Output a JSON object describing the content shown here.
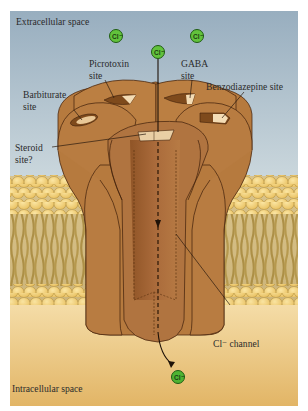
{
  "figure": {
    "regions": {
      "top": "Extracellular space",
      "bottom": "Intracellular space"
    },
    "labels": {
      "picrotoxin_1": "Picrotoxin",
      "picrotoxin_2": "site",
      "gaba_1": "GABA",
      "gaba_2": "site",
      "barbiturate_1": "Barbiturate",
      "barbiturate_2": "site",
      "benzodiazepine": "Benzodiazepine site",
      "steroid_1": "Steroid",
      "steroid_2": "site?",
      "channel": "Cl⁻ channel"
    },
    "ions": {
      "symbol": "Cl⁻",
      "count": 4
    },
    "colors": {
      "extracellular_top": "#9fb3c2",
      "extracellular_bottom": "#cbd7dc",
      "intracellular_top": "#f3d9a5",
      "intracellular_bottom": "#e3b86a",
      "protein": "#b67a3e",
      "protein_dark": "#8e5626",
      "lipid_head": "#f2d27c",
      "lipid_tail": "#b89a4e",
      "ion_fill": "#5fbf3c"
    }
  }
}
